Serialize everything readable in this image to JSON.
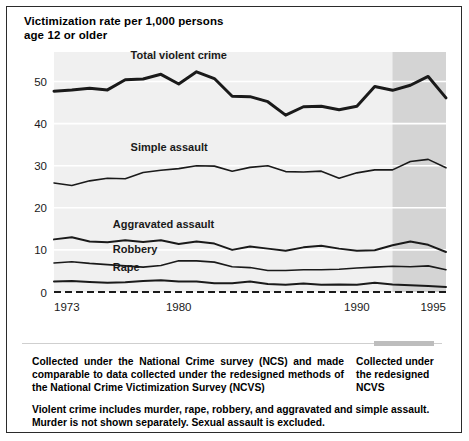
{
  "figure": {
    "title_lines": [
      "Victimization rate per 1,000 persons",
      "age 12 or older"
    ]
  },
  "footer": {
    "note_left": "Collected under the National Crime survey (NCS) and made comparable to data collected under the redesigned methods of the National Crime Victimization Survey (NCVS)",
    "note_right_lines": [
      "Collected under",
      "the redesigned",
      "NCVS"
    ],
    "note_bottom_lines": [
      "Violent crime includes murder, rape, robbery, and aggravated and simple assault.",
      "Murder is not shown separately. Sexual assault is excluded."
    ]
  },
  "colors": {
    "plot_background": "#f0f0f0",
    "shaded_band": "#d4d4d4",
    "line": "#1a1a1a",
    "frame": "#2b2b2b",
    "gridline": "#ffffff",
    "swatch": "#bdbdbd"
  },
  "chart_data": {
    "type": "line",
    "title": "Victimization rate per 1,000 persons age 12 or older",
    "xlabel": "",
    "ylabel": "",
    "xlim": [
      1973,
      1995
    ],
    "ylim": [
      0,
      57
    ],
    "yticks": [
      0,
      10,
      20,
      30,
      40,
      50
    ],
    "ytick_labels": [
      "0",
      "10",
      "20",
      "30",
      "40",
      "50"
    ],
    "xticks": [
      1973,
      1980,
      1990,
      1995
    ],
    "xtick_labels": [
      "1973",
      "1980",
      "1990",
      "1995"
    ],
    "grid": "horizontal-white-on-gray",
    "legend": "inline-series-labels",
    "x": [
      1973,
      1974,
      1975,
      1976,
      1977,
      1978,
      1979,
      1980,
      1981,
      1982,
      1983,
      1984,
      1985,
      1986,
      1987,
      1988,
      1989,
      1990,
      1991,
      1992,
      1993,
      1994,
      1995
    ],
    "series": [
      {
        "name": "Total violent crime",
        "label": "Total violent crime",
        "label_x": 1977.3,
        "label_y": 55.4,
        "line_width": 3.0,
        "values": [
          47.7,
          48.0,
          48.4,
          48.0,
          50.4,
          50.6,
          51.7,
          49.4,
          52.3,
          50.7,
          46.5,
          46.4,
          45.2,
          42.0,
          44.0,
          44.1,
          43.3,
          44.1,
          48.8,
          47.9,
          49.1,
          51.2,
          46.1
        ]
      },
      {
        "name": "Simple assault",
        "label": "Simple assault",
        "label_x": 1977.3,
        "label_y": 33.5,
        "line_width": 1.6,
        "values": [
          25.9,
          25.3,
          26.4,
          27.0,
          26.9,
          28.4,
          28.9,
          29.3,
          30.0,
          29.9,
          28.7,
          29.6,
          30.0,
          28.6,
          28.5,
          28.7,
          27.0,
          28.3,
          29.0,
          29.0,
          31.0,
          31.5,
          29.5
        ]
      },
      {
        "name": "Aggravated assault",
        "label": "Aggravated assault",
        "label_x": 1976.3,
        "label_y": 15.3,
        "line_width": 2.0,
        "values": [
          12.5,
          13.0,
          12.0,
          11.8,
          12.3,
          11.9,
          12.3,
          11.4,
          12.0,
          11.5,
          10.0,
          10.8,
          10.3,
          9.8,
          10.6,
          11.0,
          10.3,
          9.8,
          9.9,
          11.1,
          12.0,
          11.2,
          9.5
        ]
      },
      {
        "name": "Robbery",
        "label": "Robbery",
        "label_x": 1976.3,
        "label_y": 9.3,
        "line_width": 1.6,
        "values": [
          6.9,
          7.2,
          6.8,
          6.5,
          6.2,
          5.9,
          6.3,
          7.4,
          7.4,
          7.1,
          6.0,
          5.8,
          5.1,
          5.1,
          5.3,
          5.3,
          5.4,
          5.7,
          5.9,
          6.1,
          6.0,
          6.2,
          5.3
        ]
      },
      {
        "name": "Rape",
        "label": "Rape",
        "label_x": 1976.3,
        "label_y": 5.1,
        "line_width": 2.0,
        "values": [
          2.5,
          2.6,
          2.4,
          2.2,
          2.3,
          2.6,
          2.8,
          2.5,
          2.5,
          2.1,
          2.1,
          2.5,
          1.9,
          1.7,
          2.0,
          1.7,
          1.8,
          1.7,
          2.2,
          1.8,
          1.6,
          1.4,
          1.2
        ]
      }
    ],
    "annotations": [
      {
        "name": "redesign-band",
        "type": "vspan",
        "x_start": 1992.0,
        "x_end": 1995.0,
        "label": "Collected under the redesigned NCVS"
      }
    ]
  }
}
